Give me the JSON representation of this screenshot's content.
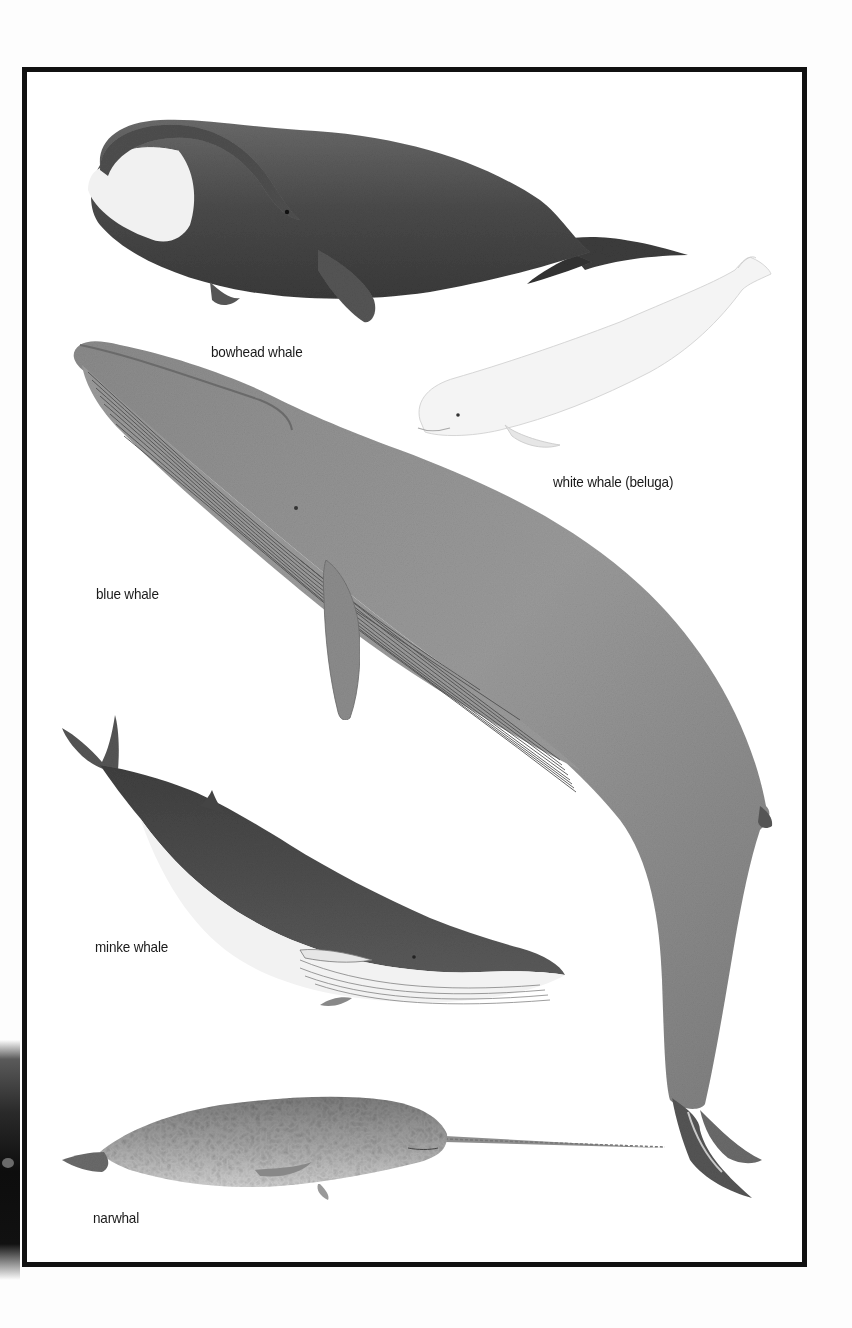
{
  "plate": {
    "background": "#ffffff",
    "frame_color": "#111111"
  },
  "whales": [
    {
      "id": "bowhead",
      "label": "bowhead whale",
      "tone": "dark grey with white chin"
    },
    {
      "id": "beluga",
      "label": "white whale (beluga)",
      "tone": "white"
    },
    {
      "id": "blue",
      "label": "blue whale",
      "tone": "mid grey, throat pleats"
    },
    {
      "id": "minke",
      "label": "minke whale",
      "tone": "dark grey back, white belly"
    },
    {
      "id": "narwhal",
      "label": "narwhal",
      "tone": "mottled grey with tusk"
    }
  ]
}
